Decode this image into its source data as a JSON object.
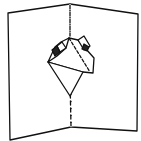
{
  "diagram": {
    "title": "Pop-up card illustration",
    "colors": {
      "stroke": "#111111",
      "background": "#ffffff",
      "fill_dark": "#222222"
    },
    "elements": [
      {
        "name": "left-panel",
        "kind": "card-panel"
      },
      {
        "name": "right-panel",
        "kind": "card-panel"
      },
      {
        "name": "fold-line",
        "kind": "dashed-line"
      },
      {
        "name": "popup-top-box",
        "kind": "folded-box"
      },
      {
        "name": "popup-diamond",
        "kind": "triangle"
      }
    ]
  }
}
